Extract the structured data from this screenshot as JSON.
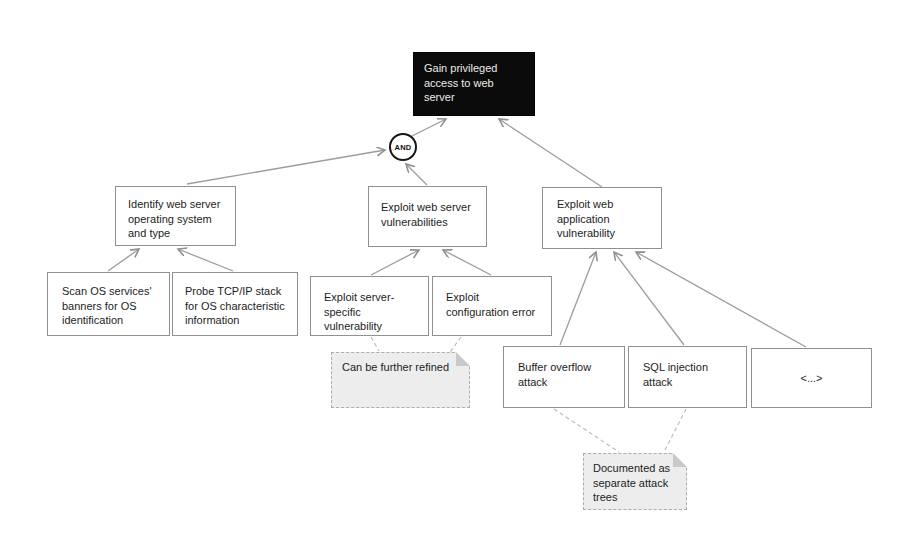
{
  "diagram": {
    "title_node": {
      "label": "Gain privileged access to web server"
    },
    "gate": {
      "label": "AND"
    },
    "nodes": {
      "identify_os": {
        "label": "Identify web server operating system and type"
      },
      "exploit_server": {
        "label": "Exploit web server vulnerabilities"
      },
      "exploit_app": {
        "label": "Exploit web application vulnerability"
      },
      "scan_banners": {
        "label": "Scan OS services' banners for OS identification"
      },
      "probe_tcpip": {
        "label": "Probe TCP/IP stack for OS characteristic information"
      },
      "exploit_specific": {
        "label": "Exploit server-specific vulnerability"
      },
      "exploit_config": {
        "label": "Exploit configuration error"
      },
      "buffer_overflow": {
        "label": "Buffer overflow attack"
      },
      "sql_injection": {
        "label": "SQL injection attack"
      },
      "placeholder": {
        "label": "<...>"
      }
    },
    "notes": {
      "refine": {
        "label": "Can be further refined"
      },
      "documented": {
        "label": "Documented as separate attack trees"
      }
    },
    "colors": {
      "root_bg": "#0b0b0b",
      "root_text": "#ebebeb",
      "box_border": "#909090",
      "box_text": "#1d1d1d",
      "line": "#9c9c9c",
      "note_bg": "#ededed",
      "note_border": "#adadad"
    }
  }
}
